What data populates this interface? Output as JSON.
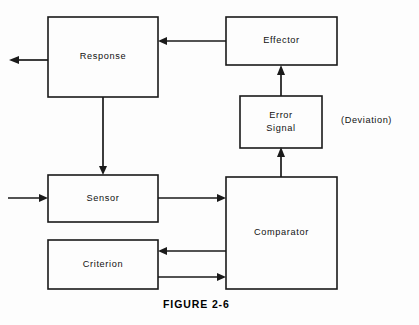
{
  "figure": {
    "caption": "FIGURE 2-6",
    "caption_x": 163,
    "caption_y": 298
  },
  "colors": {
    "background": "#fdfdfd",
    "ink": "#1a1a1a",
    "text": "#111111"
  },
  "diagram": {
    "type": "block-flow-diagram",
    "title": "FIGURE 2-6",
    "boxes": [
      {
        "id": "response",
        "label": "Response",
        "x": 48,
        "y": 17,
        "width": 110,
        "height": 80
      },
      {
        "id": "effector",
        "label": "Effector",
        "x": 226,
        "y": 17,
        "width": 111,
        "height": 48
      },
      {
        "id": "error-signal",
        "label": "Error\nSignal",
        "x": 240,
        "y": 96,
        "width": 82,
        "height": 52
      },
      {
        "id": "sensor",
        "label": "Sensor",
        "x": 48,
        "y": 175,
        "width": 110,
        "height": 47
      },
      {
        "id": "comparator",
        "label": "Comparator",
        "x": 226,
        "y": 177,
        "width": 111,
        "height": 112
      },
      {
        "id": "criterion",
        "label": "Criterion",
        "x": 48,
        "y": 240,
        "width": 110,
        "height": 49
      }
    ],
    "annotations": [
      {
        "id": "deviation",
        "label": "(Deviation)",
        "x": 341,
        "y": 115
      }
    ],
    "connections": [
      {
        "id": "effector-to-response",
        "from": "effector",
        "to": "response",
        "direction": "left"
      },
      {
        "id": "response-output",
        "from": "response",
        "to": "external-output",
        "direction": "left"
      },
      {
        "id": "response-to-sensor",
        "from": "response",
        "to": "sensor",
        "direction": "down"
      },
      {
        "id": "external-input-to-sensor",
        "from": "external-input",
        "to": "sensor",
        "direction": "right"
      },
      {
        "id": "sensor-to-comparator",
        "from": "sensor",
        "to": "comparator",
        "direction": "right"
      },
      {
        "id": "comparator-to-error-signal",
        "from": "comparator",
        "to": "error-signal",
        "direction": "up"
      },
      {
        "id": "error-signal-to-effector",
        "from": "error-signal",
        "to": "effector",
        "direction": "up"
      },
      {
        "id": "comparator-to-criterion",
        "from": "comparator",
        "to": "criterion",
        "direction": "left"
      },
      {
        "id": "criterion-to-comparator",
        "from": "criterion",
        "to": "comparator",
        "direction": "right"
      }
    ]
  }
}
